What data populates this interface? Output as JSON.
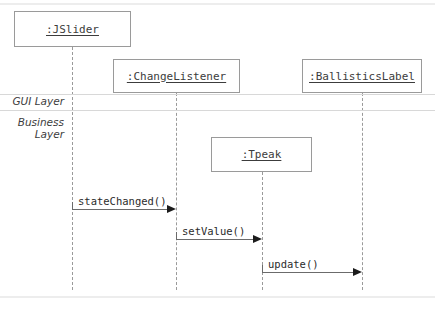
{
  "diagram": {
    "kind": "uml-sequence-diagram",
    "canvas": {
      "width": 435,
      "height": 314
    },
    "colors": {
      "background": "#ffffff",
      "box_border": "#9a9a9a",
      "lifeline": "#9a9a9a",
      "text": "#3c3c3c",
      "message_line": "#6b6b6b",
      "arrowhead": "#1c1c1c",
      "divider": "#d8d8d8",
      "band_rule": "#ededed"
    }
  },
  "layers": [
    {
      "id": "gui",
      "label": "GUI Layer"
    },
    {
      "id": "business",
      "label": "Business\nLayer"
    }
  ],
  "layer_labels": {
    "gui": "GUI Layer",
    "business_line1": "Business",
    "business_line2": "Layer"
  },
  "participants": [
    {
      "id": "jslider",
      "label": ":JSlider",
      "layer": "gui",
      "box": {
        "x": 14,
        "y": 11,
        "w": 117,
        "h": 36
      },
      "lifeline_x": 72,
      "lifeline_top": 47,
      "lifeline_bottom": 290
    },
    {
      "id": "changelistener",
      "label": ":ChangeListener",
      "layer": "gui",
      "box": {
        "x": 113,
        "y": 59,
        "w": 127,
        "h": 34
      },
      "lifeline_x": 176,
      "lifeline_top": 93,
      "lifeline_bottom": 290
    },
    {
      "id": "ballisticslabel",
      "label": ":BallisticsLabel",
      "layer": "gui",
      "box": {
        "x": 302,
        "y": 59,
        "w": 120,
        "h": 34
      },
      "lifeline_x": 362,
      "lifeline_top": 93,
      "lifeline_bottom": 290
    },
    {
      "id": "tpeak",
      "label": ":Tpeak",
      "layer": "business",
      "box": {
        "x": 211,
        "y": 137,
        "w": 101,
        "h": 35
      },
      "lifeline_x": 262,
      "lifeline_top": 172,
      "lifeline_bottom": 290
    }
  ],
  "messages": [
    {
      "id": "m1",
      "label": "stateChanged()",
      "from": "jslider",
      "to": "changelistener",
      "x1": 72,
      "x2": 176,
      "y": 209
    },
    {
      "id": "m2",
      "label": "setValue()",
      "from": "changelistener",
      "to": "tpeak",
      "x1": 176,
      "x2": 262,
      "y": 239
    },
    {
      "id": "m3",
      "label": "update()",
      "from": "tpeak",
      "to": "ballisticslabel",
      "x1": 262,
      "x2": 362,
      "y": 272
    }
  ]
}
